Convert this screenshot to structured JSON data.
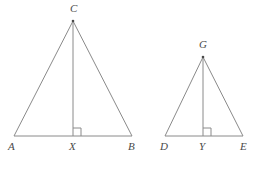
{
  "figure": {
    "background_color": "#ffffff",
    "stroke_color": "#8a8a8a",
    "label_color": "#4a4a4a",
    "stroke_width": 1,
    "triangles": [
      {
        "name": "triangle-ABC",
        "apex_label": "C",
        "base_left_label": "A",
        "base_right_label": "B",
        "foot_label": "X",
        "apex": {
          "x": 73,
          "y": 21
        },
        "base_left": {
          "x": 14,
          "y": 136
        },
        "base_right": {
          "x": 132,
          "y": 136
        },
        "foot": {
          "x": 73,
          "y": 136
        },
        "right_angle_marker": {
          "size": 8,
          "side": "right"
        }
      },
      {
        "name": "triangle-DEG",
        "apex_label": "G",
        "base_left_label": "D",
        "base_right_label": "E",
        "foot_label": "Y",
        "apex": {
          "x": 203,
          "y": 57
        },
        "base_left": {
          "x": 165,
          "y": 136
        },
        "base_right": {
          "x": 243,
          "y": 136
        },
        "foot": {
          "x": 203,
          "y": 136
        },
        "right_angle_marker": {
          "size": 8,
          "side": "right"
        }
      }
    ],
    "labels": [
      {
        "name": "label-C",
        "text": "C",
        "x": 70,
        "y": 3
      },
      {
        "name": "label-A",
        "text": "A",
        "x": 8,
        "y": 141
      },
      {
        "name": "label-X",
        "text": "X",
        "x": 69,
        "y": 141
      },
      {
        "name": "label-B",
        "text": "B",
        "x": 128,
        "y": 141
      },
      {
        "name": "label-G",
        "text": "G",
        "x": 199,
        "y": 39
      },
      {
        "name": "label-D",
        "text": "D",
        "x": 160,
        "y": 141
      },
      {
        "name": "label-Y",
        "text": "Y",
        "x": 199,
        "y": 141
      },
      {
        "name": "label-E",
        "text": "E",
        "x": 240,
        "y": 141
      }
    ]
  }
}
